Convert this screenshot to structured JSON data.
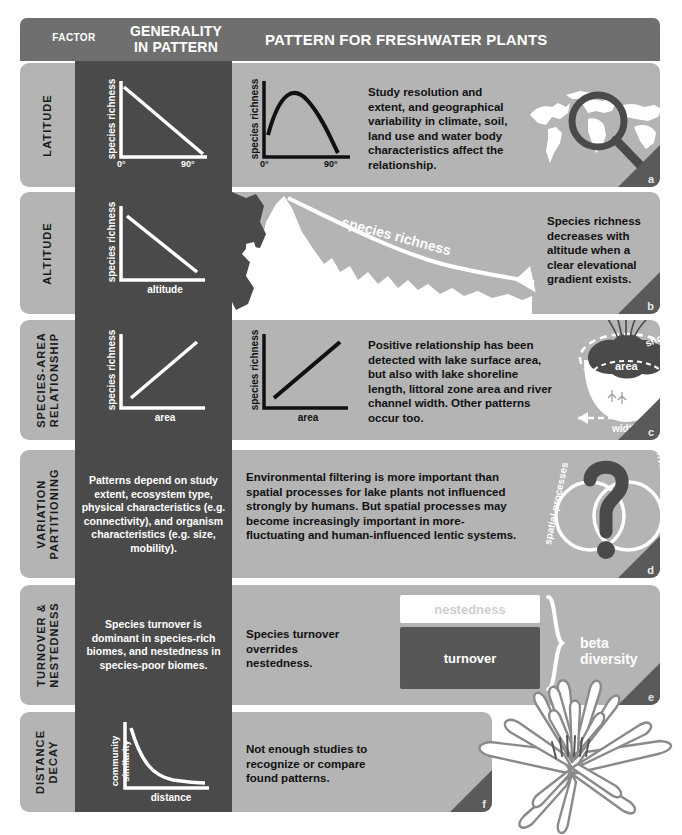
{
  "header": {
    "factor": "FACTOR",
    "generality_line1": "GENERALITY",
    "generality_line2": "IN PATTERN",
    "pattern": "PATTERN FOR FRESHWATER PLANTS"
  },
  "colors": {
    "header_bar": "#6f6f6f",
    "dark_column": "#4a4a4a",
    "row_background": "#b4b4b4",
    "corner_tab": "#5a5a5a",
    "text_dark": "#1a1a1a",
    "text_light": "#ffffff"
  },
  "rows": [
    {
      "id": "a",
      "factor": "LATITUDE",
      "generality_plot": {
        "ylabel": "species richness",
        "xlabel": "",
        "xtick_left": "0°",
        "xtick_right": "90°",
        "shape": "decreasing-linear"
      },
      "pattern_plot": {
        "ylabel": "species richness",
        "xlabel": "",
        "xtick_left": "0°",
        "xtick_right": "90°",
        "shape": "hump-shaped"
      },
      "pattern_text": "Study resolution and extent, and geographical variability in climate, soil, land use and water body characteristics affect the relationship.",
      "illustration": "world-map-with-magnifier"
    },
    {
      "id": "b",
      "factor": "ALTITUDE",
      "generality_plot": {
        "ylabel": "species richness",
        "xlabel": "altitude",
        "xtick_left": "",
        "xtick_right": "",
        "shape": "decreasing-linear"
      },
      "pattern_text": "Species richness decreases with altitude when a clear elevational gradient exists.",
      "illustration": "mountain-silhouette",
      "illustration_label": "species richness"
    },
    {
      "id": "c",
      "factor_line1": "SPECIES-AREA",
      "factor_line2": "RELATIONSHIP",
      "factor": "SPECIES-AREA RELATIONSHIP",
      "generality_plot": {
        "ylabel": "species richness",
        "xlabel": "area",
        "shape": "increasing-linear"
      },
      "pattern_plot": {
        "ylabel": "species richness",
        "xlabel": "area",
        "shape": "increasing-linear"
      },
      "pattern_text": "Positive relationship has been detected with lake surface area, but also with lake shoreline length, littoral zone area and river channel width. Other patterns occur too.",
      "illustration": "lake-cross-section",
      "illustration_labels": {
        "shoreline": "shoreline",
        "area": "area",
        "width": "width"
      }
    },
    {
      "id": "d",
      "factor_line1": "VARIATION",
      "factor_line2": "PARTITIONING",
      "factor": "VARIATION PARTITIONING",
      "generality_text": "Patterns depend on study extent, ecosystem type, physical characteristics (e.g. connectivity), and organism characteristics (e.g. size, mobility).",
      "pattern_text": "Environmental filtering is more important than spatial processes for lake plants not influenced strongly by humans. But spatial processes may become increasingly important in more-fluctuating and human-influenced lentic systems.",
      "illustration": "venn-with-question-mark",
      "illustration_labels": {
        "left": "spatial processes",
        "right": "environmental filtering"
      }
    },
    {
      "id": "e",
      "factor_line1": "TURNOVER &",
      "factor_line2": "NESTEDNESS",
      "factor": "TURNOVER & NESTEDNESS",
      "generality_text": "Species turnover is dominant in species-rich biomes, and nestedness in species-poor biomes.",
      "pattern_text": "Species turnover overrides nestedness.",
      "diagram": {
        "nestedness_label": "nestedness",
        "turnover_label": "turnover",
        "bracket_label": "beta diversity"
      }
    },
    {
      "id": "f",
      "factor_line1": "DISTANCE",
      "factor_line2": "DECAY",
      "factor": "DISTANCE DECAY",
      "generality_plot": {
        "ylabel_line1": "community",
        "ylabel_line2": "similarity",
        "ylabel": "community similarity",
        "xlabel": "distance",
        "shape": "exponential-decay"
      },
      "pattern_text": "Not enough studies to recognize or compare found patterns.",
      "illustration": "water-lily-flower"
    }
  ]
}
